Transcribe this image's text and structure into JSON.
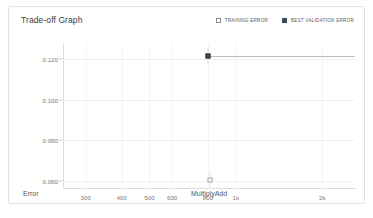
{
  "card": {
    "title": "Trade-off Graph"
  },
  "legend": {
    "items": [
      {
        "label": "TRAINING ERROR",
        "marker": "open-square",
        "color": "#8a8a8a"
      },
      {
        "label": "BEST VALIDATION ERROR",
        "marker": "filled-square",
        "color": "#3f4a54"
      }
    ]
  },
  "chart_data": {
    "type": "scatter",
    "title": "Trade-off Graph",
    "xlabel": "MultiplyAdd",
    "ylabel": "Error",
    "xscale": "log",
    "xlim": [
      250,
      2600
    ],
    "ylim": [
      0.056,
      0.128
    ],
    "grid": true,
    "legend_position": "top-right",
    "xticks": [
      {
        "value": 300,
        "label": "300"
      },
      {
        "value": 400,
        "label": "400"
      },
      {
        "value": 500,
        "label": "500"
      },
      {
        "value": 600,
        "label": "600"
      },
      {
        "value": 800,
        "label": "800"
      },
      {
        "value": 1000,
        "label": "1k"
      },
      {
        "value": 2000,
        "label": "2k"
      }
    ],
    "yticks": [
      {
        "value": 0.12,
        "label": "0.120"
      },
      {
        "value": 0.1,
        "label": "0.100"
      },
      {
        "value": 0.08,
        "label": "0.080"
      },
      {
        "value": 0.06,
        "label": "0.060"
      }
    ],
    "series": [
      {
        "name": "BEST VALIDATION ERROR",
        "marker": "filled-square",
        "color": "#3f4a54",
        "points": [
          {
            "x": 800,
            "y": 0.1215
          }
        ],
        "reference_line": {
          "y": 0.1215,
          "x_from": 800,
          "x_to": 2600,
          "color": "#b9bec4"
        }
      },
      {
        "name": "TRAINING ERROR",
        "marker": "open-square",
        "color": "#9aa0a6",
        "points": [
          {
            "x": 810,
            "y": 0.0605
          }
        ]
      }
    ]
  }
}
